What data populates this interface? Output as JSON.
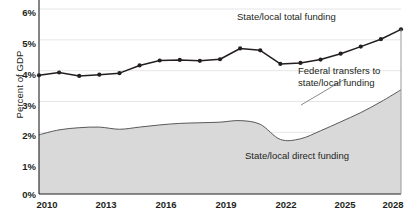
{
  "chart_data": {
    "type": "area",
    "title": "",
    "subtitle": "",
    "xlabel": "",
    "ylabel": "Percent of GDP",
    "x": [
      2010,
      2011,
      2012,
      2013,
      2014,
      2015,
      2016,
      2017,
      2018,
      2019,
      2020,
      2021,
      2022,
      2023,
      2024,
      2025,
      2026,
      2027,
      2028
    ],
    "xlim": [
      2010,
      2028
    ],
    "ylim": [
      0,
      6
    ],
    "xticks": [
      2010,
      2013,
      2016,
      2019,
      2022,
      2025,
      2028
    ],
    "xticklabels": [
      "2010",
      "2013",
      "2016",
      "2019",
      "2022",
      "2025",
      "2028"
    ],
    "yticks": [
      0,
      1,
      2,
      3,
      4,
      5,
      6
    ],
    "yticklabels": [
      "0%",
      "1%",
      "2%",
      "3%",
      "4%",
      "5%",
      "6%"
    ],
    "grid": "horizontal",
    "legend_position": "inline-annotations",
    "series": [
      {
        "name": "State/local total funding",
        "style": "line-with-markers",
        "color": "#231f20",
        "values": [
          3.85,
          3.94,
          3.83,
          3.87,
          3.92,
          4.17,
          4.33,
          4.35,
          4.32,
          4.37,
          4.72,
          4.66,
          4.22,
          4.25,
          4.36,
          4.55,
          4.78,
          5.02,
          5.34
        ]
      },
      {
        "name": "State/local direct funding",
        "style": "line",
        "color": "#58595b",
        "values": [
          1.92,
          2.08,
          2.15,
          2.17,
          2.1,
          2.17,
          2.24,
          2.29,
          2.31,
          2.33,
          2.38,
          2.26,
          1.77,
          1.79,
          2.05,
          2.34,
          2.64,
          2.99,
          3.38
        ]
      }
    ],
    "fills": [
      {
        "name": "Federal transfers to state/local funding",
        "between": [
          "State/local direct funding",
          "State/local total funding"
        ],
        "color": "#ffffff"
      },
      {
        "name": "State/local direct funding area",
        "between": [
          "baseline",
          "State/local direct funding"
        ],
        "color": "#d9d9d9"
      }
    ],
    "annotations": [
      {
        "id": "total",
        "text": "State/local total funding"
      },
      {
        "id": "federal",
        "line1": "Federal transfers to",
        "line2": "state/local funding"
      },
      {
        "id": "direct",
        "text": "State/local direct funding"
      }
    ]
  },
  "axis": {
    "y_title": "Percent of GDP"
  },
  "colors": {
    "area_fill": "#d9d9d9",
    "total_line": "#231f20",
    "direct_line": "#58595b",
    "grid": "#e6e6e6",
    "axis": "#231f20",
    "text": "#231f20"
  }
}
